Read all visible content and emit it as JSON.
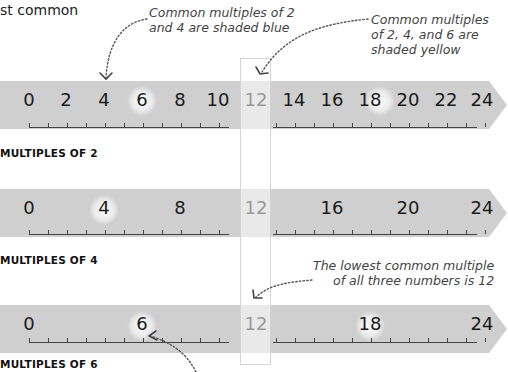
{
  "top_fragment": "st common",
  "annotations": {
    "blue_note": "Common multiples of 2\nand 4 are shaded blue",
    "blue_note_line1": "Common multiples of 2",
    "blue_note_line2": "and 4 are shaded blue",
    "yellow_note_line1": "Common multiples",
    "yellow_note_line2": "of 2, 4, and 6 are",
    "yellow_note_line3": "shaded yellow",
    "lcm_note_line1": "The lowest common multiple",
    "lcm_note_line2": "of all three numbers is 12"
  },
  "colors": {
    "strip": "#cfcfcf",
    "text": "#1a1a1a",
    "note_text": "#444444",
    "highlight_column": "#f4f4f4"
  },
  "chart_data": {
    "type": "number-line",
    "range": [
      0,
      24
    ],
    "tick_interval": 1,
    "highlight_column": 12,
    "lowest_common_multiple": 12,
    "lines": [
      {
        "label": "MULTIPLES OF 2",
        "values": [
          0,
          2,
          4,
          6,
          8,
          10,
          12,
          14,
          16,
          18,
          20,
          22,
          24
        ],
        "highlighted": [
          4,
          6,
          12,
          18
        ]
      },
      {
        "label": "MULTIPLES OF 4",
        "values": [
          0,
          4,
          8,
          12,
          16,
          20,
          24
        ],
        "highlighted": [
          4,
          12
        ]
      },
      {
        "label": "MULTIPLES OF 6",
        "values": [
          0,
          6,
          12,
          18,
          24
        ],
        "highlighted": [
          6,
          12,
          18
        ]
      }
    ]
  },
  "lines": [
    {
      "label": "MULTIPLES OF 2",
      "n": [
        "0",
        "2",
        "4",
        "6",
        "8",
        "10",
        "12",
        "14",
        "16",
        "18",
        "20",
        "22",
        "24"
      ]
    },
    {
      "label": "MULTIPLES OF 4",
      "n": [
        "0",
        "4",
        "8",
        "12",
        "16",
        "20",
        "24"
      ]
    },
    {
      "label": "MULTIPLES OF 6",
      "n": [
        "0",
        "6",
        "12",
        "18",
        "24"
      ]
    }
  ]
}
